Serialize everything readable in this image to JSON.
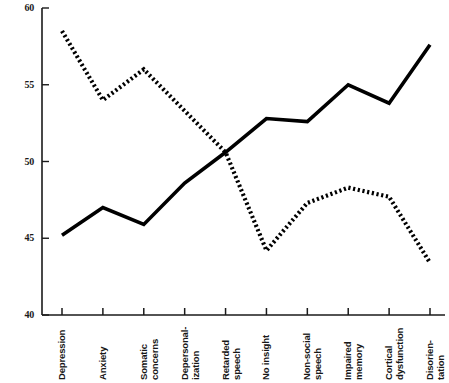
{
  "chart_data": {
    "type": "line",
    "title": "",
    "subtitle": "",
    "xlabel": "",
    "ylabel": "",
    "ylim": [
      40,
      60
    ],
    "yticks": [
      40,
      45,
      50,
      55,
      60
    ],
    "ytick_labels": [
      "40",
      "45",
      "50",
      "55",
      "60"
    ],
    "grid": false,
    "legend": null,
    "legend_position": "none",
    "categories": [
      "Depression",
      "Anxiety",
      "Somatic concerns",
      "Depersonalization",
      "Retarded speech",
      "No insight",
      "Non-social speech",
      "Impaired memory",
      "Cortical dysfunction",
      "Disorientation"
    ],
    "category_lines": [
      [
        "Depression",
        ""
      ],
      [
        "Anxiety",
        ""
      ],
      [
        "Somatic",
        "concerns"
      ],
      [
        "Depersonal-",
        "ization"
      ],
      [
        "Retarded",
        "speech"
      ],
      [
        "No insight",
        ""
      ],
      [
        "Non-social",
        "speech"
      ],
      [
        "Impaired",
        "memory"
      ],
      [
        "Cortical",
        "dysfunction"
      ],
      [
        "Disorien-",
        "tation"
      ]
    ],
    "series": [
      {
        "name": "solid-series",
        "style": "solid",
        "color": "#000000",
        "values": [
          45.2,
          47.0,
          45.9,
          48.6,
          50.6,
          52.8,
          52.6,
          55.0,
          53.8,
          57.6
        ]
      },
      {
        "name": "dotted-series",
        "style": "dotted",
        "color": "#000000",
        "values": [
          58.5,
          54.0,
          56.0,
          53.3,
          50.6,
          44.2,
          47.3,
          48.3,
          47.7,
          43.4
        ]
      }
    ]
  },
  "axes": {
    "y_axis_name": "y-axis",
    "x_axis_name": "x-axis"
  }
}
